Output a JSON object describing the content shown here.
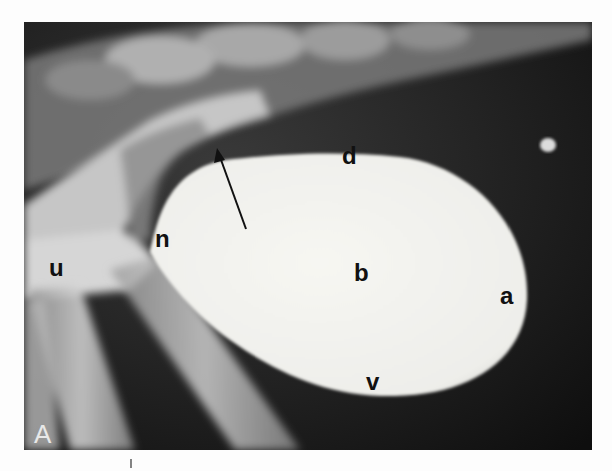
{
  "figure": {
    "type": "radiograph",
    "panel_label": "A",
    "colors": {
      "page": "#fdfdfd",
      "film_dark": "#151515",
      "bone": "#cfcfcf",
      "contrast_fill": "#f2f2ee",
      "label_text": "#111111",
      "panel_text": "#e8e8e8"
    },
    "labels": [
      {
        "id": "u",
        "text": "u",
        "x": 49,
        "y": 276
      },
      {
        "id": "n",
        "text": "n",
        "x": 155,
        "y": 247
      },
      {
        "id": "d",
        "text": "d",
        "x": 342,
        "y": 164
      },
      {
        "id": "b",
        "text": "b",
        "x": 354,
        "y": 281
      },
      {
        "id": "a",
        "text": "a",
        "x": 500,
        "y": 304
      },
      {
        "id": "v",
        "text": "v",
        "x": 366,
        "y": 390
      }
    ],
    "arrow": {
      "x1": 246,
      "y1": 229,
      "x2": 218,
      "y2": 150
    }
  }
}
